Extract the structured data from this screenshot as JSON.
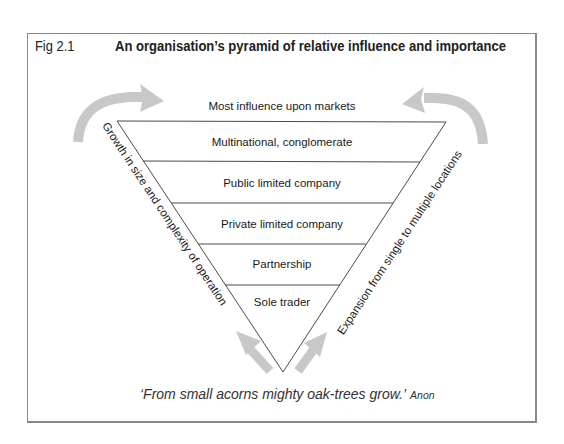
{
  "figure": {
    "label": "Fig 2.1",
    "title": "An organisation’s pyramid of relative influence and importance"
  },
  "pyramid": {
    "top_label": "Most influence upon markets",
    "levels": [
      {
        "label": "Multinational, conglomerate"
      },
      {
        "label": "Public limited company"
      },
      {
        "label": "Private limited company"
      },
      {
        "label": "Partnership"
      },
      {
        "label": "Sole trader"
      }
    ],
    "left_side_label": "Growth in size and complexity of operation",
    "right_side_label": "Expansion from single to multiple locations"
  },
  "arrows": {
    "color": "#c8c8c8",
    "items": [
      "curved-arrow-left-top",
      "curved-arrow-right-top",
      "straight-arrow-bottom-left",
      "straight-arrow-bottom-right"
    ]
  },
  "quote": {
    "text": "‘From small acorns mighty oak-trees grow.’",
    "author": "Anon"
  },
  "colors": {
    "line": "#4a4a4a",
    "frame": "#8a8a8a",
    "arrow": "#c8c8c8"
  }
}
